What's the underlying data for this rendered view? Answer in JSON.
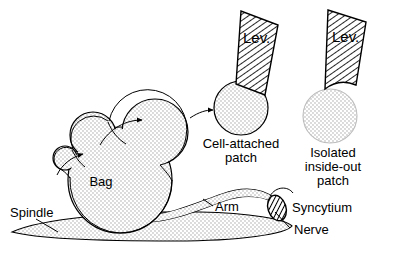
{
  "figure": {
    "background_color": "#ffffff",
    "ink_color": "#000000",
    "stipple_fill_color": "#d8d8d8",
    "hatch_color": "#000000"
  },
  "labels": {
    "spindle": "Spindle",
    "bag": "Bag",
    "arm": "Arm",
    "syncytium": "Syncytium",
    "nerve": "Nerve",
    "cell_attached_line1": "Cell-attached",
    "cell_attached_line2": "patch",
    "isolated_line1": "Isolated",
    "isolated_line2": "inside-out",
    "isolated_line3": "patch",
    "pipette_left": "Lev.",
    "pipette_right": "Lev."
  },
  "structures": {
    "blebs": [
      {
        "name": "bleb-small",
        "cx": 65,
        "cy": 158,
        "r": 12
      },
      {
        "name": "bleb-medium",
        "cx": 93,
        "cy": 135,
        "r": 23
      },
      {
        "name": "bleb-large",
        "cx": 155,
        "cy": 132,
        "r": 33
      }
    ],
    "bag": {
      "cx": 120,
      "cy": 180,
      "rx": 52,
      "ry": 53
    },
    "patches": [
      {
        "name": "cell-attached-patch",
        "cx": 241,
        "cy": 108,
        "r": 27,
        "attached": true
      },
      {
        "name": "isolated-inside-out-patch",
        "cx": 330,
        "cy": 116,
        "r": 27,
        "attached": false
      }
    ],
    "pipettes": [
      {
        "name": "pipette-cell-attached",
        "tip_x": 241,
        "tip_y": 84
      },
      {
        "name": "pipette-isolated",
        "tip_x": 330,
        "tip_y": 90
      }
    ],
    "syncytium": {
      "cx": 277,
      "cy": 208,
      "rx": 9,
      "ry": 13
    },
    "spindle": {
      "cx": 150,
      "cy": 230,
      "rx": 145,
      "ry": 14
    }
  },
  "arrows": [
    {
      "name": "arrow-small-to-medium",
      "from": "bleb-small",
      "to": "bleb-medium"
    },
    {
      "name": "arrow-medium-to-large",
      "from": "bleb-medium",
      "to": "bleb-large"
    },
    {
      "name": "arrow-large-to-patch",
      "from": "bleb-large",
      "to": "cell-attached-patch"
    }
  ],
  "leader_lines": [
    {
      "name": "leader-spindle",
      "label": "Spindle"
    },
    {
      "name": "leader-arm",
      "label": "Arm"
    },
    {
      "name": "leader-nerve",
      "label": "Nerve"
    }
  ]
}
